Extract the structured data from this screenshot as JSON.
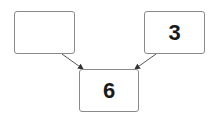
{
  "diagram": {
    "nodes": [
      {
        "id": "left",
        "label": ""
      },
      {
        "id": "right",
        "label": "3"
      },
      {
        "id": "result",
        "label": "6"
      }
    ],
    "edges": [
      {
        "from": "left",
        "to": "result"
      },
      {
        "from": "right",
        "to": "result"
      }
    ],
    "colors": {
      "border": "#8a8a8a",
      "arrow": "#333333",
      "text": "#1a1a1a"
    }
  }
}
